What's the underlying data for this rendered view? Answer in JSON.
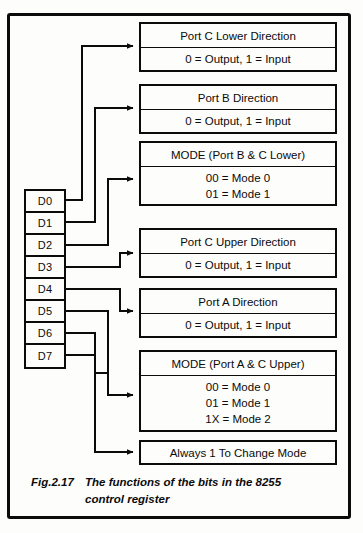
{
  "figure": {
    "caption_number": "Fig.2.17",
    "caption_line1": "The functions of the bits in the 8255",
    "caption_line2": "control register",
    "ink_color": "#0b0b0b",
    "paper_color": "#fdfdfc"
  },
  "register": {
    "name": "8255 control register bits",
    "bits": [
      {
        "label": "D0"
      },
      {
        "label": "D1"
      },
      {
        "label": "D2"
      },
      {
        "label": "D3"
      },
      {
        "label": "D4"
      },
      {
        "label": "D5"
      },
      {
        "label": "D6"
      },
      {
        "label": "D7"
      }
    ]
  },
  "boxes": [
    {
      "id": "port-c-lower-direction",
      "title": "Port C Lower Direction",
      "lines": [
        "0 = Output, 1 = Input"
      ],
      "source_bit": "D0"
    },
    {
      "id": "port-b-direction",
      "title": "Port B Direction",
      "lines": [
        "0 = Output, 1 = Input"
      ],
      "source_bit": "D1"
    },
    {
      "id": "mode-port-b-c-lower",
      "title": "MODE (Port B & C Lower)",
      "lines": [
        "00 = Mode 0",
        "01 = Mode 1"
      ],
      "source_bit": "D2"
    },
    {
      "id": "port-c-upper-direction",
      "title": "Port C Upper Direction",
      "lines": [
        "0 = Output, 1 = Input"
      ],
      "source_bit": "D3"
    },
    {
      "id": "port-a-direction",
      "title": "Port A Direction",
      "lines": [
        "0 = Output, 1 = Input"
      ],
      "source_bit": "D4"
    },
    {
      "id": "mode-port-a-c-upper",
      "title": "MODE (Port A & C Upper)",
      "lines": [
        "00 = Mode 0",
        "01 = Mode 1",
        "1X = Mode 2"
      ],
      "source_bit": "D5"
    },
    {
      "id": "always-1-to-change-mode",
      "title": "Always 1 To Change Mode",
      "lines": [],
      "source_bit": "D7"
    }
  ]
}
